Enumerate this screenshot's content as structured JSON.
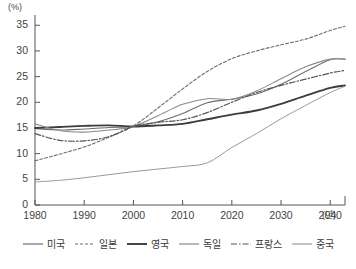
{
  "chart_data": {
    "type": "line",
    "title": "",
    "xlabel": "(년)",
    "ylabel": "(%)",
    "unit_label": "(%)",
    "xaxis_unit": "(년)",
    "xlim": [
      1980,
      2043
    ],
    "ylim": [
      0,
      37
    ],
    "grid": false,
    "legend_position": "bottom",
    "yticks": [
      0,
      5,
      10,
      15,
      20,
      25,
      30,
      35
    ],
    "ytick_labels": [
      "0",
      "5",
      "10",
      "15",
      "20",
      "25",
      "30",
      "35"
    ],
    "xticks": [
      1980,
      1990,
      2000,
      2010,
      2020,
      2030,
      2040
    ],
    "xtick_labels": [
      "1980",
      "1990",
      "2000",
      "2010",
      "2020",
      "2030",
      "2040"
    ],
    "x": [
      1980,
      1985,
      1990,
      1995,
      2000,
      2005,
      2010,
      2015,
      2020,
      2025,
      2030,
      2035,
      2040,
      2043
    ],
    "series": [
      {
        "name": "미국",
        "style": "solid",
        "color": "#6e6e6e",
        "width": 1.1,
        "values": [
          14.9,
          14.6,
          14.8,
          15.1,
          15.3,
          16.2,
          17.8,
          19.9,
          20.6,
          21.6,
          23.5,
          26.0,
          28.3,
          28.4
        ]
      },
      {
        "name": "일본",
        "style": "dotted",
        "color": "#6e6e6e",
        "width": 1.1,
        "values": [
          8.6,
          9.9,
          11.3,
          13.2,
          15.4,
          18.9,
          22.6,
          26.0,
          28.5,
          30.0,
          31.2,
          32.3,
          34.0,
          34.8
        ]
      },
      {
        "name": "영국",
        "style": "solid",
        "color": "#3c3c3c",
        "width": 1.9,
        "values": [
          15.0,
          15.2,
          15.4,
          15.5,
          15.3,
          15.5,
          15.8,
          16.7,
          17.6,
          18.4,
          19.7,
          21.3,
          22.8,
          23.3
        ]
      },
      {
        "name": "독일",
        "style": "solid",
        "color": "#8a8a8a",
        "width": 1.1,
        "values": [
          15.8,
          14.5,
          14.2,
          14.6,
          15.3,
          17.4,
          19.6,
          20.7,
          20.6,
          22.2,
          24.6,
          26.9,
          28.4,
          28.4
        ]
      },
      {
        "name": "프랑스",
        "style": "dashdot",
        "color": "#555555",
        "width": 1.2,
        "values": [
          13.9,
          12.6,
          12.5,
          13.3,
          15.3,
          16.1,
          16.6,
          18.0,
          20.0,
          21.9,
          23.3,
          24.5,
          25.7,
          26.2
        ]
      },
      {
        "name": "중국",
        "style": "solid",
        "color": "#9a9a9a",
        "width": 1.0,
        "values": [
          4.5,
          4.8,
          5.3,
          5.9,
          6.5,
          7.0,
          7.5,
          8.2,
          11.2,
          13.9,
          16.8,
          19.4,
          21.9,
          23.1
        ]
      }
    ]
  },
  "legend": {
    "items": [
      {
        "label": "미국"
      },
      {
        "label": "일본"
      },
      {
        "label": "영국"
      },
      {
        "label": "독일"
      },
      {
        "label": "프랑스"
      },
      {
        "label": "중국"
      }
    ]
  },
  "caption": {
    "text": ""
  }
}
